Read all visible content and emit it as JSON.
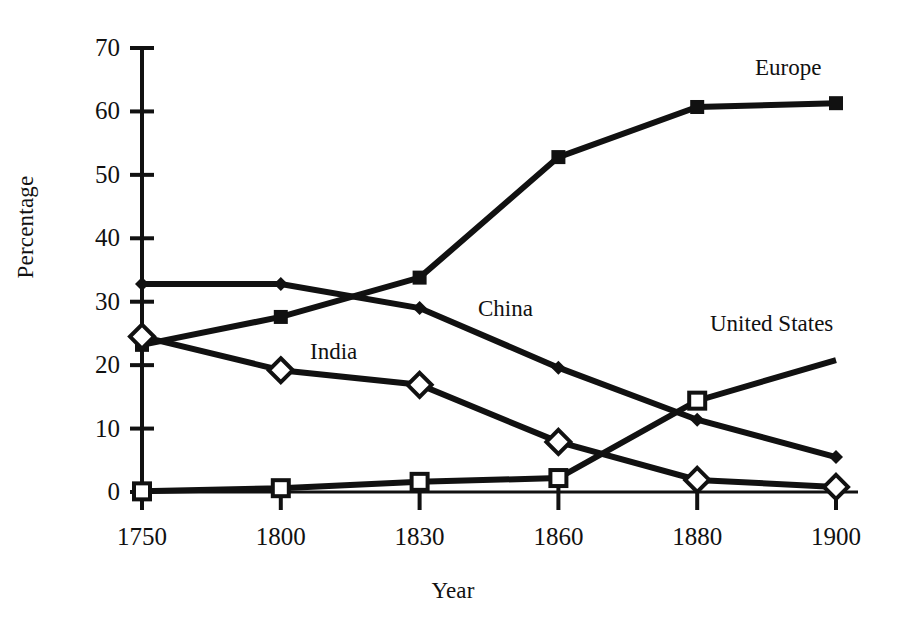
{
  "chart_data": {
    "type": "line",
    "title": "",
    "xlabel": "Year",
    "ylabel": "Percentage",
    "categories": [
      "1750",
      "1800",
      "1830",
      "1860",
      "1880",
      "1900"
    ],
    "x": [
      1750,
      1800,
      1830,
      1860,
      1880,
      1900
    ],
    "ylim": [
      0,
      70
    ],
    "yticks": [
      0,
      10,
      20,
      30,
      40,
      50,
      60,
      70
    ],
    "ytick_labels": [
      "0",
      "10",
      "20",
      "30",
      "40",
      "50",
      "60",
      "70"
    ],
    "grid": false,
    "legend_position": "inline-annotations",
    "series": [
      {
        "name": "Europe",
        "marker": "filled-square",
        "values": [
          23.2,
          27.6,
          33.8,
          52.8,
          60.7,
          61.3
        ]
      },
      {
        "name": "China",
        "marker": "small-filled-diamond",
        "values": [
          32.8,
          32.8,
          29.0,
          19.6,
          11.4,
          5.5
        ]
      },
      {
        "name": "India",
        "marker": "open-diamond",
        "values": [
          24.5,
          19.2,
          16.9,
          7.9,
          1.9,
          0.8
        ]
      },
      {
        "name": "United States",
        "marker": "open-square",
        "values": [
          0.1,
          0.6,
          1.6,
          2.2,
          14.4,
          20.8
        ]
      }
    ],
    "annotations": [
      {
        "text": "Europe",
        "x_px": 755,
        "y_px": 56
      },
      {
        "text": "China",
        "x_px": 478,
        "y_px": 297
      },
      {
        "text": "United States",
        "x_px": 710,
        "y_px": 312
      },
      {
        "text": "India",
        "x_px": 310,
        "y_px": 340
      }
    ]
  },
  "axes": {
    "y_title": "Percentage",
    "x_title": "Year"
  },
  "colors": {
    "line": "#111111",
    "background": "#ffffff",
    "text": "#111111"
  }
}
